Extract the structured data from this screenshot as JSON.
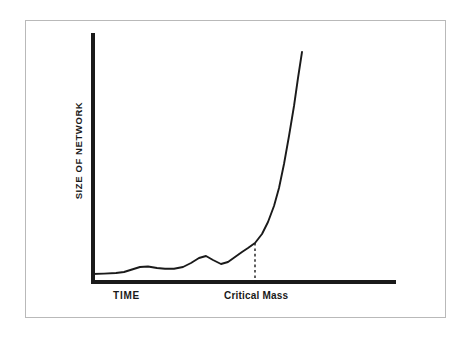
{
  "figure": {
    "background_color": "#ffffff",
    "frame_color": "#b9b9b9",
    "ink_color": "#1a1a1a"
  },
  "labels": {
    "y_axis": "SIZE OF NETWORK",
    "x_axis_left": "TIME",
    "x_axis_annotation": "Critical Mass"
  },
  "chart_data": {
    "type": "line",
    "title": "",
    "subtitle": "",
    "xlabel": "TIME",
    "ylabel": "SIZE OF NETWORK",
    "xlim": [
      0,
      100
    ],
    "ylim": [
      0,
      100
    ],
    "grid": false,
    "legend": false,
    "axis_ticks": false,
    "tick_labels": [],
    "series": [
      {
        "name": "Size of network",
        "x": [
          0,
          8,
          13,
          16,
          19,
          22,
          26,
          30,
          33,
          37,
          41,
          46,
          50,
          54,
          58,
          62,
          66,
          70,
          74,
          78,
          82,
          86,
          90,
          94,
          98,
          100
        ],
        "y": [
          3.5,
          3.6,
          3.8,
          4.2,
          5.2,
          6.4,
          6.6,
          6.1,
          5.8,
          5.8,
          6.3,
          7.6,
          9.5,
          10.4,
          9.2,
          7.9,
          8.8,
          10.6,
          12.6,
          14.6,
          16.6,
          17.0,
          17.0,
          17.0,
          17.0,
          17.0
        ]
      }
    ],
    "curve_points_px": [
      [
        92,
        274
      ],
      [
        104,
        273.6
      ],
      [
        116,
        273
      ],
      [
        124,
        272
      ],
      [
        132,
        269.5
      ],
      [
        140,
        267
      ],
      [
        148,
        266.5
      ],
      [
        157,
        268
      ],
      [
        165,
        268.7
      ],
      [
        174,
        268.7
      ],
      [
        183,
        267
      ],
      [
        191,
        263
      ],
      [
        199,
        258
      ],
      [
        206,
        256
      ],
      [
        213,
        260
      ],
      [
        221,
        264
      ],
      [
        228,
        262
      ],
      [
        235,
        257
      ],
      [
        242,
        252
      ],
      [
        248,
        248
      ],
      [
        255,
        243
      ],
      [
        262,
        234
      ],
      [
        268,
        222
      ],
      [
        274,
        206
      ],
      [
        279,
        188
      ],
      [
        284,
        164
      ],
      [
        289,
        136
      ],
      [
        294,
        106
      ],
      [
        298,
        78
      ],
      [
        302,
        52
      ]
    ],
    "annotations": [
      {
        "name": "critical-mass-marker",
        "label": "Critical Mass",
        "style": "dashed-vertical",
        "x_px": 255,
        "y_top_px": 243,
        "y_bottom_px": 283,
        "x_fraction": 0.536,
        "y_value": 17.0
      }
    ],
    "axes_px": {
      "y_axis_x": 93,
      "y_axis_top": 33,
      "y_axis_bottom": 283,
      "x_axis_y": 282,
      "x_axis_left": 91,
      "x_axis_right": 396
    }
  }
}
